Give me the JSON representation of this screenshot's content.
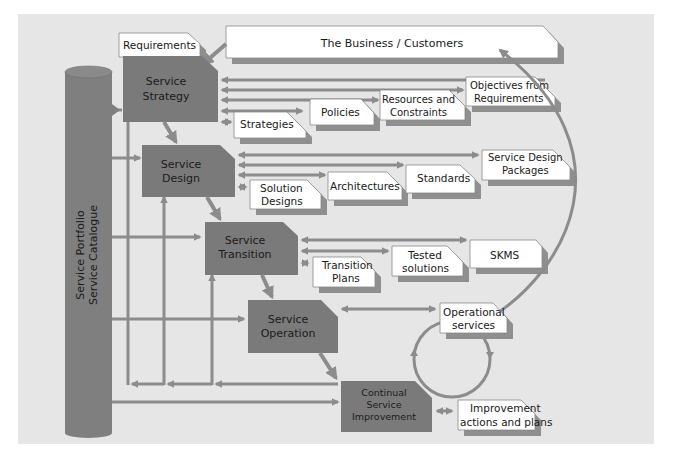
{
  "diagram": {
    "colors": {
      "background": "#e6e6e6",
      "stage_fill": "#7a7a7a",
      "arrow": "#8c8c8c",
      "box_fill": "#ffffff",
      "box_shadow": "#8f8f8f",
      "pillar": "#7f7f7f"
    },
    "business": {
      "label": "The Business / Customers"
    },
    "requirements": {
      "label": "Requirements"
    },
    "pillar": {
      "line1": "Service Portfolio",
      "line2": "Service Catalogue"
    },
    "stages": [
      {
        "id": "strategy",
        "line1": "Service",
        "line2": "Strategy",
        "line3": ""
      },
      {
        "id": "design",
        "line1": "Service",
        "line2": "Design",
        "line3": ""
      },
      {
        "id": "transition",
        "line1": "Service",
        "line2": "Transition",
        "line3": ""
      },
      {
        "id": "operation",
        "line1": "Service",
        "line2": "Operation",
        "line3": ""
      },
      {
        "id": "csi",
        "line1": "Continual",
        "line2": "Service",
        "line3": "Improvement"
      }
    ],
    "outputs": {
      "strategy": [
        {
          "line1": "Strategies",
          "line2": ""
        },
        {
          "line1": "Policies",
          "line2": ""
        },
        {
          "line1": "Resources and",
          "line2": "Constraints"
        },
        {
          "line1": "Objectives from",
          "line2": "Requirements"
        }
      ],
      "design": [
        {
          "line1": "Solution",
          "line2": "Designs"
        },
        {
          "line1": "Architectures",
          "line2": ""
        },
        {
          "line1": "Standards",
          "line2": ""
        },
        {
          "line1": "Service Design",
          "line2": "Packages"
        }
      ],
      "transition": [
        {
          "line1": "Transition",
          "line2": "Plans"
        },
        {
          "line1": "Tested",
          "line2": "solutions"
        },
        {
          "line1": "SKMS",
          "line2": ""
        }
      ],
      "operation": [
        {
          "line1": "Operational",
          "line2": "services"
        }
      ],
      "csi": [
        {
          "line1": "Improvement",
          "line2": "actions and plans"
        }
      ]
    }
  }
}
